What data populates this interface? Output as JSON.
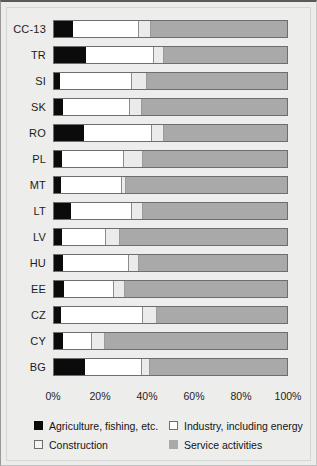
{
  "chart_data": {
    "type": "bar",
    "subtype": "stacked-horizontal-100pct",
    "title": "",
    "xlabel": "",
    "ylabel": "",
    "xlim": [
      0,
      100
    ],
    "xticks": [
      "0%",
      "20%",
      "40%",
      "60%",
      "80%",
      "100%"
    ],
    "xtick_values": [
      0,
      20,
      40,
      60,
      80,
      100
    ],
    "grid": false,
    "legend_position": "bottom",
    "categories": [
      "CC-13",
      "TR",
      "SI",
      "SK",
      "RO",
      "PL",
      "MT",
      "LT",
      "LV",
      "HU",
      "EE",
      "CZ",
      "CY",
      "BG"
    ],
    "series": [
      {
        "name": "Agriculture, fishing, etc.",
        "color": "#0b0b0b",
        "values": [
          8.1,
          13.6,
          2.6,
          3.8,
          12.8,
          3.4,
          3.0,
          7.2,
          3.4,
          3.8,
          4.3,
          3.0,
          3.8,
          13.2
        ]
      },
      {
        "name": "Industry, including energy",
        "color": "#ffffff",
        "values": [
          28.1,
          28.9,
          30.6,
          28.5,
          28.9,
          26.4,
          26.0,
          26.0,
          18.7,
          28.1,
          21.3,
          34.9,
          12.3,
          24.3
        ]
      },
      {
        "name": "Construction",
        "color": "#ebebeb",
        "values": [
          5.1,
          4.3,
          6.4,
          5.1,
          5.1,
          8.1,
          1.7,
          4.7,
          6.0,
          4.3,
          4.7,
          6.0,
          5.5,
          3.4
        ]
      },
      {
        "name": "Service activities",
        "color": "#a9a9a9",
        "values": [
          58.7,
          53.2,
          60.4,
          62.6,
          53.2,
          62.1,
          69.3,
          62.1,
          71.9,
          63.8,
          69.7,
          56.1,
          78.4,
          59.1
        ]
      }
    ]
  },
  "axis": {
    "ticks": [
      {
        "label": "0%",
        "value": 0
      },
      {
        "label": "20%",
        "value": 20
      },
      {
        "label": "40%",
        "value": 40
      },
      {
        "label": "60%",
        "value": 60
      },
      {
        "label": "80%",
        "value": 80
      },
      {
        "label": "100%",
        "value": 100
      }
    ]
  },
  "legend": {
    "items": [
      {
        "label": "Agriculture, fishing, etc.",
        "swatch": "agri"
      },
      {
        "label": "Industry, including energy",
        "swatch": "ind"
      },
      {
        "label": "Construction",
        "swatch": "con"
      },
      {
        "label": "Service activities",
        "swatch": "serv"
      }
    ]
  },
  "colors": {
    "agriculture": "#0b0b0b",
    "industry": "#ffffff",
    "construction": "#ebebeb",
    "services": "#a9a9a9",
    "background": "#ededec",
    "bar_border": "#6e6e6e"
  }
}
